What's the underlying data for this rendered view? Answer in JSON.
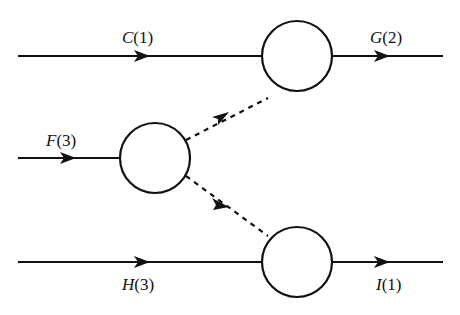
{
  "diagram": {
    "type": "flow-network",
    "colors": {
      "stroke": "#111111",
      "background": "#ffffff"
    },
    "nodes": [
      {
        "id": "top",
        "cx": 297,
        "cy": 56,
        "r": 35
      },
      {
        "id": "middle",
        "cx": 155,
        "cy": 158,
        "r": 35
      },
      {
        "id": "bottom",
        "cx": 297,
        "cy": 262,
        "r": 35
      }
    ],
    "edges": [
      {
        "id": "C",
        "name": "C",
        "value": "1",
        "label": "C(1)",
        "style": "solid",
        "from": "input",
        "to": "top"
      },
      {
        "id": "G",
        "name": "G",
        "value": "2",
        "label": "G(2)",
        "style": "solid",
        "from": "top",
        "to": "output"
      },
      {
        "id": "F",
        "name": "F",
        "value": "3",
        "label": "F(3)",
        "style": "solid",
        "from": "input",
        "to": "middle"
      },
      {
        "id": "H",
        "name": "H",
        "value": "3",
        "label": "H(3)",
        "style": "solid",
        "from": "input",
        "to": "bottom"
      },
      {
        "id": "I",
        "name": "I",
        "value": "1",
        "label": "I(1)",
        "style": "solid",
        "from": "bottom",
        "to": "output"
      },
      {
        "id": "mid-top",
        "label": "",
        "style": "dashed",
        "from": "middle",
        "to": "top"
      },
      {
        "id": "mid-bottom",
        "label": "",
        "style": "dashed",
        "from": "middle",
        "to": "bottom"
      }
    ]
  },
  "labels": {
    "C": {
      "name": "C",
      "value": "(1)"
    },
    "G": {
      "name": "G",
      "value": "(2)"
    },
    "F": {
      "name": "F",
      "value": "(3)"
    },
    "H": {
      "name": "H",
      "value": "(3)"
    },
    "I": {
      "name": "I",
      "value": "(1)"
    }
  }
}
